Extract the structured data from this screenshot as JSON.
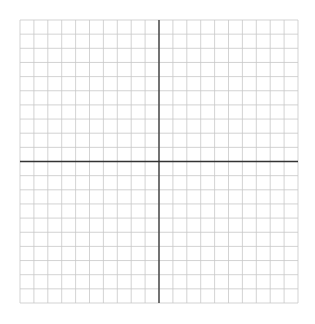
{
  "chart_data": {
    "type": "scatter",
    "title": "",
    "xlabel": "",
    "ylabel": "",
    "grid": true,
    "x": [],
    "y": [],
    "xlim": [
      -10,
      10
    ],
    "ylim": [
      -10,
      10
    ],
    "cells_x": 20,
    "cells_y": 20,
    "legend": []
  },
  "layout": {
    "left": 20,
    "top": 20,
    "right": 298,
    "bottom": 303
  },
  "colors": {
    "grid": "#c8c8c8",
    "axis": "#333333",
    "background": "#ffffff"
  }
}
